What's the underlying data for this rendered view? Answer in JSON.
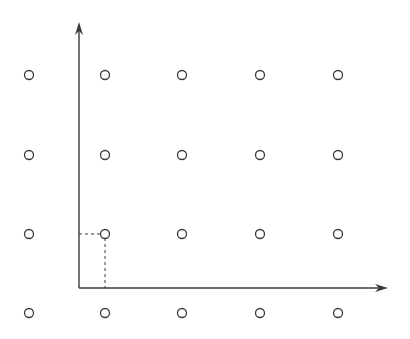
{
  "diagram": {
    "type": "lattice with axes",
    "colors": {
      "stroke": "#3a3a3a",
      "background": "#ffffff"
    },
    "lattice_columns_x": [
      29,
      105,
      182,
      260,
      338
    ],
    "lattice_rows_y": [
      75,
      155,
      234,
      313
    ],
    "origin": [
      79,
      288
    ],
    "y_axis_top": 22,
    "x_axis_right": 388,
    "highlighted_point": [
      105,
      234
    ]
  }
}
